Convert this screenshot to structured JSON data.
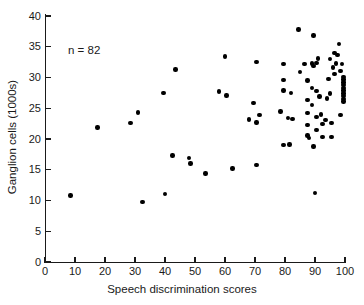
{
  "chart_data": {
    "type": "scatter",
    "title": "",
    "xlabel": "Speech discrimination scores",
    "ylabel": "Ganglion cells (1000s)",
    "xlim": [
      0,
      100
    ],
    "ylim": [
      0,
      40
    ],
    "xticks": [
      0,
      10,
      20,
      30,
      40,
      50,
      60,
      70,
      80,
      90,
      100
    ],
    "yticks": [
      0,
      5,
      10,
      15,
      20,
      25,
      30,
      35,
      40
    ],
    "grid": false,
    "legend": null,
    "annotations": [
      {
        "text": "n = 82",
        "x": 16,
        "y": 35
      }
    ],
    "marker": {
      "shape": "circle",
      "color": "#000000",
      "size": 4.4
    },
    "n_points": 82,
    "points": [
      {
        "x": 8.5,
        "y": 10.8
      },
      {
        "x": 17.5,
        "y": 21.9
      },
      {
        "x": 28.5,
        "y": 22.6
      },
      {
        "x": 31.0,
        "y": 24.3
      },
      {
        "x": 32.5,
        "y": 9.8
      },
      {
        "x": 39.5,
        "y": 27.5
      },
      {
        "x": 40.0,
        "y": 11.1
      },
      {
        "x": 42.5,
        "y": 17.3
      },
      {
        "x": 43.5,
        "y": 31.3
      },
      {
        "x": 48.0,
        "y": 16.9
      },
      {
        "x": 48.5,
        "y": 16.0
      },
      {
        "x": 53.5,
        "y": 14.4
      },
      {
        "x": 58.0,
        "y": 27.7
      },
      {
        "x": 60.0,
        "y": 33.4
      },
      {
        "x": 60.5,
        "y": 27.1
      },
      {
        "x": 62.5,
        "y": 15.2
      },
      {
        "x": 68.0,
        "y": 23.2
      },
      {
        "x": 69.5,
        "y": 25.9
      },
      {
        "x": 70.5,
        "y": 32.5
      },
      {
        "x": 70.5,
        "y": 22.7
      },
      {
        "x": 70.5,
        "y": 15.8
      },
      {
        "x": 71.5,
        "y": 23.9
      },
      {
        "x": 78.5,
        "y": 24.5
      },
      {
        "x": 79.5,
        "y": 32.2
      },
      {
        "x": 79.5,
        "y": 29.6
      },
      {
        "x": 79.5,
        "y": 27.9
      },
      {
        "x": 79.5,
        "y": 19.0
      },
      {
        "x": 81.0,
        "y": 23.4
      },
      {
        "x": 81.5,
        "y": 19.1
      },
      {
        "x": 82.0,
        "y": 27.5
      },
      {
        "x": 82.5,
        "y": 23.3
      },
      {
        "x": 84.5,
        "y": 37.8
      },
      {
        "x": 85.0,
        "y": 30.9
      },
      {
        "x": 86.5,
        "y": 32.2
      },
      {
        "x": 87.5,
        "y": 29.5
      },
      {
        "x": 87.5,
        "y": 26.3
      },
      {
        "x": 87.5,
        "y": 24.2
      },
      {
        "x": 87.5,
        "y": 22.3
      },
      {
        "x": 87.5,
        "y": 20.6
      },
      {
        "x": 88.0,
        "y": 20.2
      },
      {
        "x": 89.0,
        "y": 32.3
      },
      {
        "x": 89.0,
        "y": 28.3
      },
      {
        "x": 89.0,
        "y": 25.5
      },
      {
        "x": 89.5,
        "y": 36.8
      },
      {
        "x": 89.5,
        "y": 31.9
      },
      {
        "x": 89.5,
        "y": 18.8
      },
      {
        "x": 90.0,
        "y": 11.2
      },
      {
        "x": 90.5,
        "y": 32.4
      },
      {
        "x": 90.5,
        "y": 27.8
      },
      {
        "x": 90.5,
        "y": 23.6
      },
      {
        "x": 90.5,
        "y": 21.5
      },
      {
        "x": 91.0,
        "y": 33.1
      },
      {
        "x": 91.5,
        "y": 26.9
      },
      {
        "x": 92.0,
        "y": 24.0
      },
      {
        "x": 92.5,
        "y": 22.4
      },
      {
        "x": 92.5,
        "y": 20.3
      },
      {
        "x": 93.5,
        "y": 23.1
      },
      {
        "x": 94.0,
        "y": 26.6
      },
      {
        "x": 94.5,
        "y": 29.8
      },
      {
        "x": 95.0,
        "y": 33.0
      },
      {
        "x": 95.0,
        "y": 27.4
      },
      {
        "x": 95.5,
        "y": 22.6
      },
      {
        "x": 95.5,
        "y": 20.3
      },
      {
        "x": 96.0,
        "y": 31.6
      },
      {
        "x": 96.5,
        "y": 34.0
      },
      {
        "x": 96.5,
        "y": 30.6
      },
      {
        "x": 97.0,
        "y": 32.3
      },
      {
        "x": 97.5,
        "y": 33.7
      },
      {
        "x": 98.0,
        "y": 35.4
      },
      {
        "x": 98.5,
        "y": 31.1
      },
      {
        "x": 98.5,
        "y": 23.9
      },
      {
        "x": 99.0,
        "y": 32.2
      },
      {
        "x": 99.5,
        "y": 30.1
      },
      {
        "x": 99.5,
        "y": 29.7
      },
      {
        "x": 99.5,
        "y": 29.2
      },
      {
        "x": 99.5,
        "y": 28.8
      },
      {
        "x": 99.5,
        "y": 28.3
      },
      {
        "x": 99.5,
        "y": 27.9
      },
      {
        "x": 99.5,
        "y": 27.4
      },
      {
        "x": 99.5,
        "y": 27.0
      },
      {
        "x": 99.5,
        "y": 26.5
      },
      {
        "x": 99.5,
        "y": 26.1
      }
    ]
  }
}
